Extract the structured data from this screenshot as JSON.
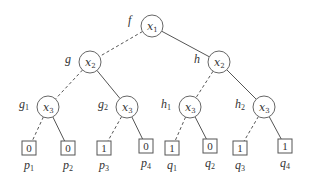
{
  "diagram": {
    "type": "binary-decision-tree",
    "edge_legend": {
      "low": "dashed",
      "high": "solid"
    },
    "nodes": [
      {
        "id": "root",
        "var": "x",
        "sub": "1",
        "label": "f",
        "label_sub": "",
        "cx": 152,
        "cy": 26
      },
      {
        "id": "g",
        "var": "x",
        "sub": "2",
        "label": "g",
        "label_sub": "",
        "cx": 90,
        "cy": 62
      },
      {
        "id": "h",
        "var": "x",
        "sub": "2",
        "label": "h",
        "label_sub": "",
        "cx": 219,
        "cy": 62
      },
      {
        "id": "g1",
        "var": "x",
        "sub": "3",
        "label": "g",
        "label_sub": "1",
        "cx": 48,
        "cy": 107
      },
      {
        "id": "g2",
        "var": "x",
        "sub": "3",
        "label": "g",
        "label_sub": "2",
        "cx": 127,
        "cy": 107
      },
      {
        "id": "h1",
        "var": "x",
        "sub": "3",
        "label": "h",
        "label_sub": "1",
        "cx": 190,
        "cy": 107
      },
      {
        "id": "h2",
        "var": "x",
        "sub": "3",
        "label": "h",
        "label_sub": "2",
        "cx": 264,
        "cy": 107
      }
    ],
    "leaves": [
      {
        "id": "p1",
        "value": "0",
        "label": "p",
        "label_sub": "1",
        "cx": 29,
        "cy": 148
      },
      {
        "id": "p2",
        "value": "0",
        "label": "p",
        "label_sub": "2",
        "cx": 68,
        "cy": 148
      },
      {
        "id": "p3",
        "value": "1",
        "label": "p",
        "label_sub": "3",
        "cx": 104,
        "cy": 148
      },
      {
        "id": "p4",
        "value": "0",
        "label": "p",
        "label_sub": "4",
        "cx": 146,
        "cy": 146
      },
      {
        "id": "q1",
        "value": "1",
        "label": "q",
        "label_sub": "1",
        "cx": 172,
        "cy": 148
      },
      {
        "id": "q2",
        "value": "0",
        "label": "q",
        "label_sub": "2",
        "cx": 210,
        "cy": 146
      },
      {
        "id": "q3",
        "value": "1",
        "label": "q",
        "label_sub": "3",
        "cx": 240,
        "cy": 148
      },
      {
        "id": "q4",
        "value": "1",
        "label": "q",
        "label_sub": "4",
        "cx": 285,
        "cy": 146
      }
    ],
    "edges": [
      {
        "from": "root",
        "to": "g",
        "style": "dashed"
      },
      {
        "from": "root",
        "to": "h",
        "style": "solid"
      },
      {
        "from": "g",
        "to": "g1",
        "style": "dashed"
      },
      {
        "from": "g",
        "to": "g2",
        "style": "solid"
      },
      {
        "from": "h",
        "to": "h1",
        "style": "dashed"
      },
      {
        "from": "h",
        "to": "h2",
        "style": "solid"
      },
      {
        "from": "g1",
        "to": "p1",
        "style": "dashed"
      },
      {
        "from": "g1",
        "to": "p2",
        "style": "solid"
      },
      {
        "from": "g2",
        "to": "p3",
        "style": "dashed"
      },
      {
        "from": "g2",
        "to": "p4",
        "style": "solid"
      },
      {
        "from": "h1",
        "to": "q1",
        "style": "dashed"
      },
      {
        "from": "h1",
        "to": "q2",
        "style": "solid"
      },
      {
        "from": "h2",
        "to": "q3",
        "style": "dashed"
      },
      {
        "from": "h2",
        "to": "q4",
        "style": "solid"
      }
    ]
  }
}
